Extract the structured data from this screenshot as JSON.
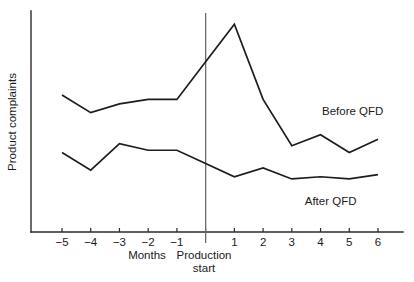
{
  "chart_data": {
    "type": "line",
    "title": "",
    "xlabel": "Months",
    "ylabel": "Product complaints",
    "x": [
      -5,
      -4,
      -3,
      -2,
      -1,
      0,
      1,
      2,
      3,
      4,
      5,
      6
    ],
    "xtick_labels": [
      "−5",
      "−4",
      "−3",
      "−2",
      "−1",
      "",
      "1",
      "2",
      "3",
      "4",
      "5",
      "6"
    ],
    "xlim": [
      -5.6,
      6.6
    ],
    "ylim": [
      0,
      100
    ],
    "yticks": [],
    "ytick_labels": [],
    "grid": false,
    "legend_position": "inline-right",
    "series": [
      {
        "name": "Before QFD",
        "color": "#1d1d1d",
        "values": [
          62,
          54,
          58,
          60,
          60,
          77,
          94,
          60,
          39,
          44,
          36,
          42
        ],
        "label_x": 4.05,
        "label_y": 53
      },
      {
        "name": "After QFD",
        "color": "#1d1d1d",
        "values": [
          36,
          28,
          40,
          37,
          37,
          31,
          25,
          29,
          24,
          25,
          24,
          26
        ],
        "label_x": 3.45,
        "label_y": 12
      }
    ],
    "annotations": [
      {
        "name": "production-start",
        "text_line1": "Production",
        "text_line2": "start",
        "x": 0,
        "type": "vertical-rule"
      }
    ]
  },
  "axis": {
    "x_axis_label": "Months",
    "y_axis_label": "Product complaints"
  },
  "colors": {
    "background": "#ffffff",
    "axis": "#2b2b2b",
    "line": "#1d1d1d",
    "rule": "#6b6b6b",
    "text": "#1a1a1a"
  }
}
